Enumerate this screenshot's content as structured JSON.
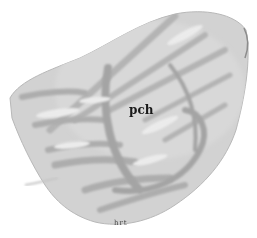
{
  "figure": {
    "labels": {
      "center": "pch",
      "bottom": "hrt"
    },
    "colors": {
      "background": "#ffffff",
      "tissue_light": "#d4d4d4",
      "tissue_mid": "#bdbdbd",
      "tissue_dark": "#9e9e9e",
      "highlight": "#ececec"
    }
  }
}
